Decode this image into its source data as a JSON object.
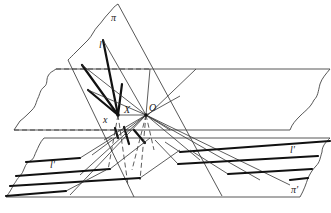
{
  "figure": {
    "type": "projective-geometry-diagram",
    "labels": {
      "plane_pi": "π",
      "plane_pi_prime": "π'",
      "line_l": "l",
      "line_l_prime_left": "l'",
      "line_l_prime_right": "l'",
      "point_X": "X",
      "point_O": "O",
      "axis_x": "x"
    },
    "colors": {
      "background": "#ffffff",
      "line": "#222222"
    }
  }
}
